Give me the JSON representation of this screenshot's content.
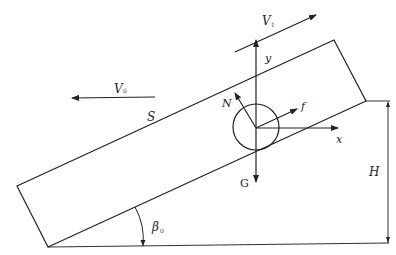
{
  "diagram": {
    "type": "free-body diagram on inclined plane",
    "colors": {
      "line": "#222222",
      "background": "#ffffff"
    },
    "labels": {
      "v0": "V",
      "v0_sub": "0",
      "v1": "V",
      "v1_sub": "1",
      "s": "S",
      "n": "N",
      "f": "f",
      "x": "x",
      "y": "y",
      "g": "G",
      "h": "H",
      "beta": "β",
      "beta_sub": "0"
    }
  }
}
